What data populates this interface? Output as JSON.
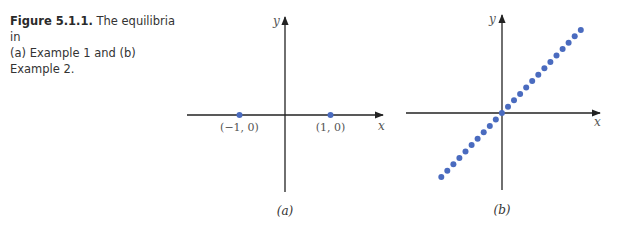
{
  "caption": {
    "figure_label": "Figure 5.1.1.",
    "text_line1": " The equilibria in",
    "text_line2": "(a) Example 1 and (b) Example 2."
  },
  "colors": {
    "dot": "#4a6bbf",
    "axis": "#222222"
  },
  "chart_data": [
    {
      "type": "scatter",
      "panel_label": "(a)",
      "xlabel": "x",
      "ylabel": "y",
      "xlim": [
        -2.1,
        2.1
      ],
      "ylim": [
        -1.7,
        2.1
      ],
      "grid": false,
      "points": [
        {
          "x": -1,
          "y": 0,
          "label": "(−1, 0)"
        },
        {
          "x": 1,
          "y": 0,
          "label": "(1, 0)"
        }
      ]
    },
    {
      "type": "scatter",
      "panel_label": "(b)",
      "xlabel": "x",
      "ylabel": "y",
      "xlim": [
        -2.1,
        2.1
      ],
      "ylim": [
        -1.7,
        2.1
      ],
      "grid": false,
      "description": "line of equilibria along y = x",
      "points_line": {
        "slope": 1,
        "x_from": -1.35,
        "x_to": 1.75,
        "count": 24
      }
    }
  ]
}
